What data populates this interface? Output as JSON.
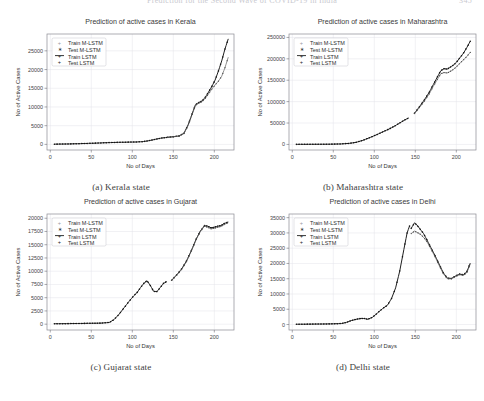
{
  "header": {
    "running_title": "Prediction for the Second Wave of COVID-19 in India",
    "page_number": "345"
  },
  "figure": {
    "panels": [
      {
        "caption": "(a) Kerala state",
        "chart_data": {
          "type": "line",
          "title": "Prediction of active cases in Kerala",
          "xlabel": "No of Days",
          "ylabel": "No of Active Cases",
          "xlim": [
            -4,
            224
          ],
          "ylim": [
            -1500,
            29500
          ],
          "xticks": [
            0,
            50,
            100,
            150,
            200
          ],
          "yticks": [
            0,
            5000,
            10000,
            15000,
            20000,
            25000
          ],
          "grid": true,
          "legend_position": "upper left",
          "legend": [
            "Train M-LSTM",
            "Test M-LSTM",
            "Train LSTM",
            "Test LSTM"
          ],
          "series": [
            {
              "name": "Train",
              "x": [
                5,
                15,
                25,
                35,
                45,
                55,
                65,
                75,
                85,
                95,
                105,
                112,
                118,
                124,
                130,
                136,
                142
              ],
              "values": [
                60,
                90,
                130,
                190,
                260,
                330,
                420,
                500,
                560,
                600,
                640,
                720,
                900,
                1150,
                1450,
                1700,
                1850
              ]
            },
            {
              "name": "Test M-LSTM",
              "x": [
                143,
                150,
                157,
                163,
                168,
                173,
                177,
                181,
                185,
                189,
                193,
                197,
                201,
                205,
                209,
                213,
                217
              ],
              "values": [
                1900,
                2050,
                2250,
                3000,
                5200,
                8200,
                10600,
                11200,
                11600,
                12600,
                14000,
                15500,
                17200,
                19600,
                22300,
                25500,
                28200
              ]
            },
            {
              "name": "Test LSTM",
              "x": [
                143,
                150,
                157,
                163,
                168,
                173,
                177,
                181,
                185,
                189,
                193,
                197,
                201,
                205,
                209,
                213,
                217
              ],
              "values": [
                1880,
                2020,
                2200,
                2900,
                5000,
                8000,
                10400,
                11000,
                11400,
                12300,
                13500,
                14800,
                15900,
                16900,
                18200,
                20500,
                23300
              ]
            }
          ]
        }
      },
      {
        "caption": "(b) Maharashtra state",
        "chart_data": {
          "type": "line",
          "title": "Prediction of active cases in Maharashtra",
          "xlabel": "No of Days",
          "ylabel": "No of Active Cases",
          "xlim": [
            -4,
            224
          ],
          "ylim": [
            -13000,
            258000
          ],
          "xticks": [
            0,
            50,
            100,
            150,
            200
          ],
          "yticks": [
            0,
            50000,
            100000,
            150000,
            200000,
            250000
          ],
          "grid": true,
          "legend_position": "upper left",
          "legend": [
            "Train M-LSTM",
            "Test M-LSTM",
            "Train LSTM",
            "Test LSTM"
          ],
          "series": [
            {
              "name": "Train",
              "x": [
                5,
                20,
                35,
                50,
                60,
                70,
                78,
                86,
                94,
                102,
                110,
                118,
                124,
                130,
                136,
                142
              ],
              "values": [
                200,
                300,
                450,
                700,
                1200,
                2600,
                5000,
                9500,
                15500,
                22000,
                29000,
                36000,
                42000,
                49000,
                56000,
                62000
              ]
            },
            {
              "name": "Test M-LSTM",
              "x": [
                149,
                155,
                161,
                167,
                172,
                177,
                181,
                185,
                189,
                193,
                197,
                201,
                205,
                209,
                213,
                217
              ],
              "values": [
                73000,
                88000,
                104000,
                122000,
                140000,
                158000,
                172000,
                177000,
                176000,
                181000,
                186000,
                194000,
                204000,
                214000,
                227000,
                241000
              ]
            },
            {
              "name": "Test LSTM",
              "x": [
                149,
                155,
                161,
                167,
                172,
                177,
                181,
                185,
                189,
                193,
                197,
                201,
                205,
                209,
                213,
                217
              ],
              "values": [
                72000,
                86000,
                101000,
                118000,
                136000,
                152000,
                165000,
                168000,
                167000,
                171000,
                176000,
                183000,
                191000,
                198000,
                206000,
                215000
              ]
            }
          ]
        }
      },
      {
        "caption": "(c) Gujarat state",
        "chart_data": {
          "type": "line",
          "title": "Prediction of active cases in Gujarat",
          "xlabel": "No of Days",
          "ylabel": "No of Active Cases",
          "xlim": [
            -4,
            224
          ],
          "ylim": [
            -1100,
            20800
          ],
          "xticks": [
            0,
            50,
            100,
            150,
            200
          ],
          "yticks": [
            0,
            2500,
            5000,
            7500,
            10000,
            12500,
            15000,
            17500,
            20000
          ],
          "grid": true,
          "legend_position": "upper left",
          "legend": [
            "Train M-LSTM",
            "Test M-LSTM",
            "Train LSTM",
            "Test LSTM"
          ],
          "series": [
            {
              "name": "Train",
              "x": [
                5,
                20,
                35,
                50,
                62,
                72,
                78,
                84,
                90,
                96,
                102,
                106,
                110,
                114,
                118,
                122,
                126,
                130,
                134,
                138,
                142
              ],
              "values": [
                80,
                100,
                130,
                170,
                200,
                320,
                900,
                1900,
                3100,
                4300,
                5400,
                6000,
                6900,
                7700,
                8200,
                7300,
                6200,
                6150,
                6900,
                7700,
                8050
              ]
            },
            {
              "name": "Test M-LSTM",
              "x": [
                148,
                154,
                160,
                166,
                172,
                178,
                183,
                188,
                192,
                196,
                200,
                204,
                208,
                212,
                217
              ],
              "values": [
                8300,
                9300,
                10400,
                11900,
                13900,
                16100,
                17600,
                18600,
                18500,
                18200,
                18300,
                18500,
                18600,
                19000,
                19300
              ]
            },
            {
              "name": "Test LSTM",
              "x": [
                148,
                154,
                160,
                166,
                172,
                178,
                183,
                188,
                192,
                196,
                200,
                204,
                208,
                212,
                217
              ],
              "values": [
                8250,
                9200,
                10300,
                11800,
                13800,
                16000,
                17500,
                18500,
                18300,
                18000,
                18100,
                18300,
                18450,
                18800,
                19150
              ]
            }
          ]
        }
      },
      {
        "caption": "(d) Delhi state",
        "chart_data": {
          "type": "line",
          "title": "Prediction of active cases in Delhi",
          "xlabel": "No of Days",
          "ylabel": "No of Active Cases",
          "xlim": [
            -4,
            224
          ],
          "ylim": [
            -1800,
            36200
          ],
          "xticks": [
            0,
            50,
            100,
            150,
            200
          ],
          "yticks": [
            0,
            5000,
            10000,
            15000,
            20000,
            25000,
            30000,
            35000
          ],
          "grid": true,
          "legend_position": "upper left",
          "legend": [
            "Train M-LSTM",
            "Test M-LSTM",
            "Train LSTM",
            "Test LSTM"
          ],
          "series": [
            {
              "name": "Train",
              "x": [
                5,
                20,
                35,
                50,
                60,
                66,
                72,
                78,
                84,
                88,
                92,
                98,
                104,
                110,
                116,
                121,
                126,
                131,
                136,
                140,
                143
              ],
              "values": [
                90,
                120,
                160,
                220,
                320,
                700,
                1300,
                1700,
                2000,
                1950,
                1700,
                2400,
                3800,
                5200,
                6300,
                8500,
                12000,
                17500,
                24500,
                30000,
                32300
              ]
            },
            {
              "name": "Test M-LSTM",
              "x": [
                145,
                149,
                152,
                156,
                160,
                164,
                169,
                174,
                179,
                184,
                189,
                194,
                199,
                204,
                209,
                213,
                217
              ],
              "values": [
                31500,
                33300,
                32600,
                31200,
                29800,
                27800,
                25200,
                22600,
                19800,
                17000,
                15200,
                15100,
                15900,
                16500,
                16300,
                17400,
                20100
              ]
            },
            {
              "name": "Test LSTM",
              "x": [
                145,
                149,
                152,
                156,
                160,
                164,
                169,
                174,
                179,
                184,
                189,
                194,
                199,
                204,
                209,
                213,
                217
              ],
              "values": [
                29800,
                30600,
                30200,
                29600,
                28600,
                27200,
                24800,
                22200,
                19400,
                16700,
                15000,
                14950,
                15700,
                16300,
                16100,
                17100,
                19800
              ]
            }
          ]
        }
      }
    ]
  }
}
